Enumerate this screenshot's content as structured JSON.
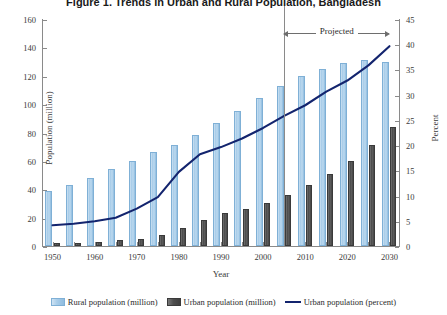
{
  "chart_data": {
    "type": "bar",
    "title": "Figure 1. Trends in Urban and Rural Population, Bangladesh",
    "xlabel": "Year",
    "ylabel": "Population (million)",
    "y2label": "Percent",
    "ylim": [
      0,
      160
    ],
    "y2lim": [
      0,
      45
    ],
    "grid": false,
    "legend_position": "bottom",
    "categories": [
      "1950",
      "1955",
      "1960",
      "1965",
      "1970",
      "1975",
      "1980",
      "1985",
      "1990",
      "1995",
      "2000",
      "2005",
      "2010",
      "2015",
      "2020",
      "2025",
      "2030"
    ],
    "xtick_labels": [
      "1950",
      "1960",
      "1970",
      "1980",
      "1990",
      "2000",
      "2010",
      "2020",
      "2030"
    ],
    "ytick_labels": [
      "0",
      "20",
      "40",
      "60",
      "80",
      "100",
      "120",
      "140",
      "160"
    ],
    "y2tick_labels": [
      "0",
      "5",
      "10",
      "15",
      "20",
      "25",
      "30",
      "35",
      "40",
      "45"
    ],
    "series": [
      {
        "name": "Rural population (million)",
        "axis": "left",
        "type": "bar",
        "color": "#a9cde9",
        "values": [
          39,
          43,
          48,
          54,
          60,
          66,
          71,
          78,
          87,
          95,
          104,
          113,
          120,
          125,
          129,
          131,
          130
        ]
      },
      {
        "name": "Urban population (million)",
        "axis": "left",
        "type": "bar",
        "color": "#4d4d4d",
        "values": [
          2,
          2,
          3,
          4,
          5,
          8,
          13,
          18,
          23,
          26,
          30,
          36,
          43,
          51,
          60,
          71,
          84
        ]
      },
      {
        "name": "Urban population (percent)",
        "axis": "right",
        "type": "line",
        "color": "#13246e",
        "values": [
          4.3,
          4.6,
          5.1,
          5.8,
          7.6,
          9.9,
          14.9,
          18.4,
          19.8,
          21.5,
          23.6,
          26.0,
          28.1,
          30.8,
          33.0,
          36.0,
          39.8
        ]
      }
    ],
    "annotations": [
      {
        "label": "Projected",
        "from": "2005",
        "to": "2030"
      }
    ]
  },
  "legend": {
    "items": [
      {
        "label": "Rural population (million)",
        "swatch": "rural-bar-swatch"
      },
      {
        "label": "Urban population (million)",
        "swatch": "urban-bar-swatch"
      },
      {
        "label": "Urban population (percent)",
        "swatch": "percent-line-swatch"
      }
    ]
  },
  "colors": {
    "rural": "#a9cde9",
    "urban": "#4d4d4d",
    "percent_line": "#13246e",
    "axis": "#8a8a8a",
    "background": "#ffffff"
  }
}
